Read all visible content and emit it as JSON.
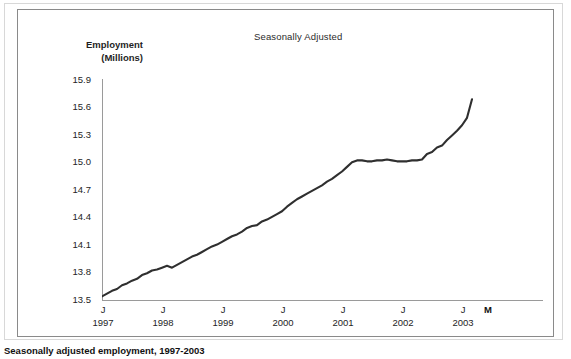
{
  "figure": {
    "title": "Seasonally Adjusted",
    "caption": "Seasonally adjusted employment, 1997-2003",
    "axis_label_line1": "Employment",
    "axis_label_line2": "(Millions)",
    "end_marker_label": "M",
    "line_color": "#2f2f2f",
    "axis_color": "#9a9a9a",
    "frame_color": "#8a8a8a",
    "text_color": "#242424",
    "background": "#ffffff"
  },
  "chart_data": {
    "type": "line",
    "title": "Seasonally Adjusted",
    "xlabel": "",
    "ylabel": "Employment (Millions)",
    "ylim": [
      13.5,
      15.9
    ],
    "yticks": [
      "13.5",
      "13.8",
      "14.1",
      "14.4",
      "14.7",
      "15.0",
      "15.3",
      "15.6",
      "15.9"
    ],
    "ytick_values": [
      13.5,
      13.8,
      14.1,
      14.4,
      14.7,
      15.0,
      15.3,
      15.6,
      15.9
    ],
    "xticks": [
      "J",
      "J",
      "J",
      "J",
      "J",
      "J",
      "J"
    ],
    "xtick_years": [
      "1997",
      "1998",
      "1999",
      "2000",
      "2001",
      "2002",
      "2003"
    ],
    "xlim_labels": [
      "J 1997",
      "M 2003"
    ],
    "grid": false,
    "legend": "none",
    "series": [
      {
        "name": "Employment (Millions), seasonally adjusted",
        "x": [
          "1997-01",
          "1997-02",
          "1997-03",
          "1997-04",
          "1997-05",
          "1997-06",
          "1997-07",
          "1997-08",
          "1997-09",
          "1997-10",
          "1997-11",
          "1997-12",
          "1998-01",
          "1998-02",
          "1998-03",
          "1998-04",
          "1998-05",
          "1998-06",
          "1998-07",
          "1998-08",
          "1998-09",
          "1998-10",
          "1998-11",
          "1998-12",
          "1999-01",
          "1999-02",
          "1999-03",
          "1999-04",
          "1999-05",
          "1999-06",
          "1999-07",
          "1999-08",
          "1999-09",
          "1999-10",
          "1999-11",
          "1999-12",
          "2000-01",
          "2000-02",
          "2000-03",
          "2000-04",
          "2000-05",
          "2000-06",
          "2000-07",
          "2000-08",
          "2000-09",
          "2000-10",
          "2000-11",
          "2000-12",
          "2001-01",
          "2001-02",
          "2001-03",
          "2001-04",
          "2001-05",
          "2001-06",
          "2001-07",
          "2001-08",
          "2001-09",
          "2001-10",
          "2001-11",
          "2001-12",
          "2002-01",
          "2002-02",
          "2002-03",
          "2002-04",
          "2002-05",
          "2002-06",
          "2002-07",
          "2002-08",
          "2002-09",
          "2002-10",
          "2002-11",
          "2002-12",
          "2003-01",
          "2003-02",
          "2003-03"
        ],
        "values": [
          13.55,
          13.58,
          13.61,
          13.63,
          13.67,
          13.69,
          13.72,
          13.74,
          13.78,
          13.8,
          13.83,
          13.84,
          13.86,
          13.88,
          13.86,
          13.89,
          13.92,
          13.95,
          13.98,
          14.0,
          14.03,
          14.06,
          14.09,
          14.11,
          14.14,
          14.17,
          14.2,
          14.22,
          14.25,
          14.29,
          14.31,
          14.32,
          14.36,
          14.38,
          14.41,
          14.44,
          14.47,
          14.52,
          14.56,
          14.6,
          14.63,
          14.66,
          14.69,
          14.72,
          14.75,
          14.79,
          14.82,
          14.86,
          14.9,
          14.95,
          15.0,
          15.02,
          15.02,
          15.01,
          15.01,
          15.02,
          15.02,
          15.03,
          15.02,
          15.01,
          15.01,
          15.01,
          15.02,
          15.02,
          15.03,
          15.09,
          15.11,
          15.16,
          15.18,
          15.24,
          15.29,
          15.34,
          15.4,
          15.48,
          15.68
        ]
      }
    ]
  }
}
